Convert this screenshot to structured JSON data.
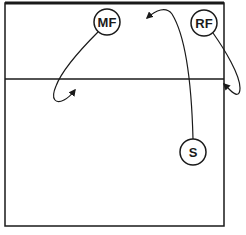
{
  "diagram": {
    "type": "volleyball-court-play",
    "players": [
      {
        "id": "mf",
        "label": "MF",
        "cx": 107,
        "cy": 22
      },
      {
        "id": "rf",
        "label": "RF",
        "cx": 204,
        "cy": 23
      },
      {
        "id": "s",
        "label": "S",
        "cx": 193,
        "cy": 152
      }
    ],
    "colors": {
      "line": "#1a1a1a",
      "background": "#ffffff"
    }
  }
}
